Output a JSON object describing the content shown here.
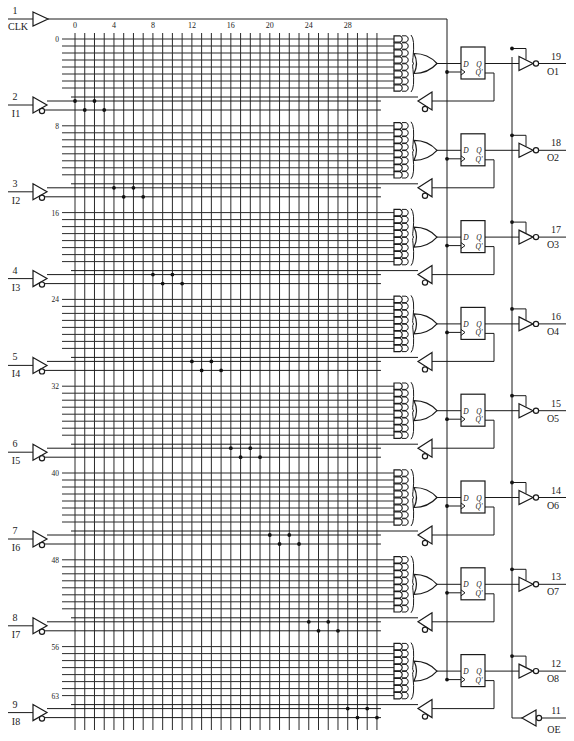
{
  "colors": {
    "line": "#1a1a1a",
    "background": "#ffffff"
  },
  "clock": {
    "pin": "1",
    "name": "CLK"
  },
  "output_enable": {
    "pin": "11",
    "name": "OE"
  },
  "column_labels": [
    "0",
    "4",
    "8",
    "12",
    "16",
    "20",
    "24",
    "28"
  ],
  "row_labels": [
    "0",
    "8",
    "16",
    "24",
    "32",
    "40",
    "48",
    "56",
    "63"
  ],
  "inputs": [
    {
      "pin": "2",
      "name": "I1"
    },
    {
      "pin": "3",
      "name": "I2"
    },
    {
      "pin": "4",
      "name": "I3"
    },
    {
      "pin": "5",
      "name": "I4"
    },
    {
      "pin": "6",
      "name": "I5"
    },
    {
      "pin": "7",
      "name": "I6"
    },
    {
      "pin": "8",
      "name": "I7"
    },
    {
      "pin": "9",
      "name": "I8"
    }
  ],
  "outputs": [
    {
      "pin": "19",
      "name": "O1"
    },
    {
      "pin": "18",
      "name": "O2"
    },
    {
      "pin": "17",
      "name": "O3"
    },
    {
      "pin": "16",
      "name": "O4"
    },
    {
      "pin": "15",
      "name": "O5"
    },
    {
      "pin": "14",
      "name": "O6"
    },
    {
      "pin": "13",
      "name": "O7"
    },
    {
      "pin": "12",
      "name": "O8"
    }
  ],
  "flipflop_labels": {
    "d": "D",
    "q": "Q",
    "qn": "Q'"
  }
}
